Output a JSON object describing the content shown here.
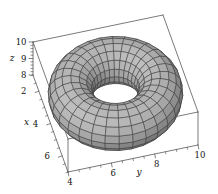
{
  "figure": {
    "kind": "3d-surface-plot",
    "background_color": "#ffffff"
  },
  "chart_data": {
    "type": "surface3d",
    "surface": "torus",
    "title": "",
    "torus": {
      "center": [
        4,
        7,
        9
      ],
      "major_radius": 2,
      "minor_radius": 1,
      "u_segments": 30,
      "v_segments": 16
    },
    "axes": {
      "x": {
        "label": "x",
        "range": [
          1,
          7
        ],
        "major_ticks": [
          2,
          4,
          6
        ],
        "minor_step": 0.5
      },
      "y": {
        "label": "y",
        "range": [
          4,
          10
        ],
        "major_ticks": [
          4,
          6,
          8,
          10
        ],
        "minor_step": 0.5
      },
      "z": {
        "label": "z",
        "range": [
          8,
          10
        ],
        "major_ticks": [
          8,
          9,
          10
        ],
        "minor_step": 0.2
      }
    },
    "style": {
      "surface_base_gray": 112,
      "surface_gray_span": 78,
      "ambient": 0.12,
      "light_direction": [
        0.3,
        -0.45,
        0.84
      ],
      "mesh_line_color": "#3a3a3a",
      "box_line_color": "#4d4d4d",
      "label_color": "#111111",
      "tick_font_size": 8.5,
      "letter_font_size": 9
    },
    "projection": {
      "origin_px": [
        33,
        75
      ],
      "x_dir_px": [
        5.833,
        16.167
      ],
      "y_dir_px": [
        21.667,
        -4.5
      ],
      "z_dir_px": [
        0,
        -16.5
      ],
      "depth_dir": [
        0.949,
        -0.256,
        1
      ]
    },
    "canvas": {
      "width": 218,
      "height": 194
    }
  }
}
